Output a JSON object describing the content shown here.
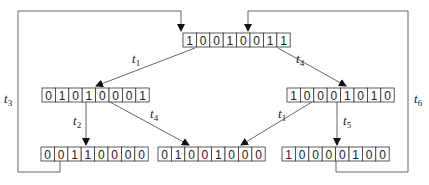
{
  "diagram": {
    "type": "state-transition",
    "nodes": [
      {
        "id": "root",
        "bits": [
          "1",
          "0",
          "0",
          "1",
          "0",
          "0",
          "1",
          "1"
        ],
        "x": 183,
        "y": 33
      },
      {
        "id": "mid_left",
        "bits": [
          "0",
          "1",
          "0",
          "1",
          "0",
          "0",
          "0",
          "1"
        ],
        "x": 42,
        "y": 88
      },
      {
        "id": "mid_right",
        "bits": [
          "1",
          "0",
          "0",
          "0",
          "1",
          "0",
          "1",
          "0"
        ],
        "x": 287,
        "y": 88
      },
      {
        "id": "bot_left",
        "bits": [
          "0",
          "0",
          "1",
          "1",
          "0",
          "0",
          "0",
          "0"
        ],
        "x": 41,
        "y": 147
      },
      {
        "id": "bot_center",
        "bits": [
          "0",
          "1",
          "0",
          "0",
          "1",
          "0",
          "0",
          "0"
        ],
        "x": 158,
        "y": 147
      },
      {
        "id": "bot_right",
        "bits": [
          "1",
          "0",
          "0",
          "0",
          "0",
          "1",
          "0",
          "0"
        ],
        "x": 282,
        "y": 147
      }
    ],
    "edges": [
      {
        "from": "root",
        "to": "mid_left",
        "label": "t",
        "sub": "1"
      },
      {
        "from": "root",
        "to": "mid_right",
        "label": "t",
        "sub": "4"
      },
      {
        "from": "mid_left",
        "to": "bot_left",
        "label": "t",
        "sub": "2"
      },
      {
        "from": "mid_left",
        "to": "bot_center",
        "label": "t",
        "sub": "4"
      },
      {
        "from": "mid_right",
        "to": "bot_center",
        "label": "t",
        "sub": "1"
      },
      {
        "from": "mid_right",
        "to": "bot_right",
        "label": "t",
        "sub": "5"
      },
      {
        "from": "bot_left",
        "to": "root",
        "label": "t",
        "sub": "3"
      },
      {
        "from": "bot_right",
        "to": "root",
        "label": "t",
        "sub": "6"
      }
    ],
    "colors": {
      "line": "#555555",
      "cell_border": "#333333",
      "text": "#222222"
    }
  }
}
